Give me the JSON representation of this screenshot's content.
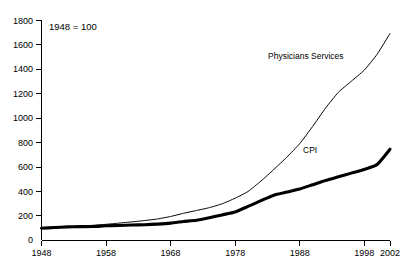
{
  "chart_data": {
    "type": "line",
    "title": "",
    "note": "1948 = 100",
    "xlabel": "",
    "ylabel": "",
    "xlim": [
      1948,
      2002
    ],
    "ylim": [
      0,
      1800
    ],
    "grid": false,
    "legend_position": "inline-annotation",
    "x_ticks": [
      1948,
      1958,
      1968,
      1978,
      1988,
      1998,
      2002
    ],
    "x_tick_labels": [
      "1948",
      "1958",
      "1968",
      "1978",
      "1988",
      "1998",
      "2002"
    ],
    "y_ticks": [
      0,
      200,
      400,
      600,
      800,
      1000,
      1200,
      1400,
      1600,
      1800
    ],
    "y_tick_labels": [
      "0",
      "200",
      "400",
      "600",
      "800",
      "1000",
      "1200",
      "1400",
      "1600",
      "1800"
    ],
    "x": [
      1948,
      1950,
      1952,
      1954,
      1956,
      1958,
      1960,
      1962,
      1964,
      1966,
      1968,
      1970,
      1972,
      1974,
      1976,
      1978,
      1980,
      1982,
      1984,
      1986,
      1988,
      1990,
      1992,
      1994,
      1996,
      1998,
      2000,
      2002
    ],
    "series": [
      {
        "name": "Physicians Services",
        "label": "Physicians Services",
        "style": "thin",
        "values": [
          100,
          105,
          112,
          118,
          124,
          132,
          142,
          152,
          163,
          176,
          196,
          222,
          245,
          268,
          300,
          345,
          400,
          485,
          580,
          680,
          790,
          930,
          1080,
          1210,
          1300,
          1390,
          1520,
          1690
        ]
      },
      {
        "name": "CPI",
        "label": "CPI",
        "style": "thick",
        "values": [
          100,
          106,
          111,
          113,
          114,
          120,
          123,
          126,
          129,
          134,
          142,
          155,
          166,
          186,
          209,
          233,
          278,
          325,
          370,
          395,
          420,
          455,
          490,
          520,
          550,
          580,
          620,
          745
        ]
      }
    ],
    "annotations": [
      {
        "text": "Physicians Services",
        "x_px": 268,
        "y_px": 56
      },
      {
        "text": "CPI",
        "x_px": 303,
        "y_px": 150
      },
      {
        "text": "1948 = 100",
        "x_px": 49,
        "y_px": 27
      }
    ]
  }
}
